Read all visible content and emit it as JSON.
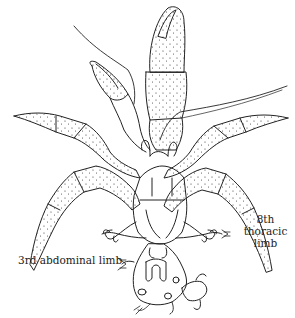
{
  "figure": {
    "labels": {
      "eighth_thoracic_line1": "8th thoracic",
      "eighth_thoracic_line2": "limb",
      "third_abdominal": "3rd abdominal limb"
    }
  },
  "colors": {
    "ink": "#222222",
    "background": "#ffffff"
  }
}
